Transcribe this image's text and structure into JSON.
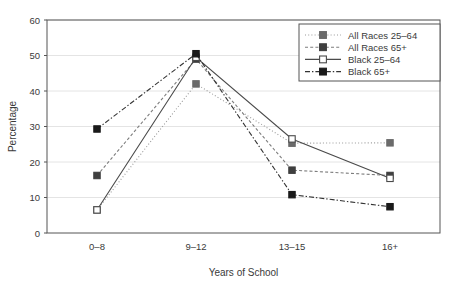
{
  "chart_data": {
    "type": "line",
    "title": "",
    "xlabel": "Years of School",
    "ylabel": "Percentage",
    "categories": [
      "0–8",
      "9–12",
      "13–15",
      "16+"
    ],
    "ylim": [
      0,
      60
    ],
    "yticks": [
      0,
      10,
      20,
      30,
      40,
      50,
      60
    ],
    "ytick_labels": [
      "0",
      "10",
      "20",
      "30",
      "40",
      "50",
      "60"
    ],
    "grid": "horizontal",
    "legend_position": "top-right",
    "series": [
      {
        "name": "All Races 25–64",
        "values": [
          6.5,
          42.0,
          25.3,
          25.4
        ],
        "color": "#9a9a9a",
        "line_style": "dotted",
        "marker": "filled-square",
        "marker_color": "#6b6b6b"
      },
      {
        "name": "All Races 65+",
        "values": [
          16.2,
          49.0,
          17.7,
          16.2
        ],
        "color": "#7d7d7d",
        "line_style": "dashed",
        "marker": "filled-square",
        "marker_color": "#3f3f3f"
      },
      {
        "name": "Black 25–64",
        "values": [
          6.5,
          49.5,
          26.5,
          15.4
        ],
        "color": "#4a4a4a",
        "line_style": "solid",
        "marker": "open-square",
        "marker_color": "#ffffff"
      },
      {
        "name": "Black 65+",
        "values": [
          29.3,
          50.5,
          10.8,
          7.4
        ],
        "color": "#333333",
        "line_style": "dash-dot",
        "marker": "filled-square",
        "marker_color": "#1a1a1a"
      }
    ]
  },
  "axes": {
    "ylabel": "Percentage",
    "xlabel": "Years of School"
  },
  "legend": {
    "items": [
      {
        "label": "All Races 25–64"
      },
      {
        "label": "All Races 65+"
      },
      {
        "label": "Black 25–64"
      },
      {
        "label": "Black 65+"
      }
    ]
  },
  "colors": {
    "axis": "#555555",
    "grid": "#e4e4e4",
    "text": "#3a3a3a",
    "background": "#ffffff"
  }
}
